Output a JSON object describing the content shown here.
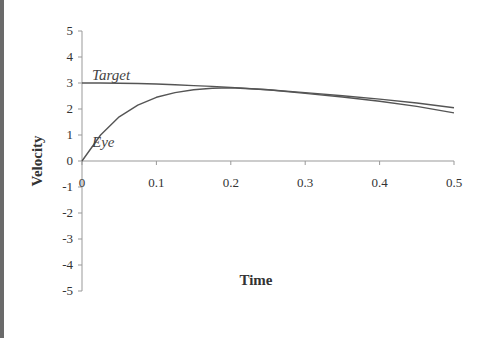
{
  "chart_data": {
    "type": "line",
    "title": "",
    "xlabel": "Time",
    "ylabel": "Velocity",
    "xlim": [
      0,
      0.5
    ],
    "ylim": [
      -5,
      5
    ],
    "x_ticks": [
      "0",
      "0.1",
      "0.2",
      "0.3",
      "0.4",
      "0.5"
    ],
    "y_ticks": [
      "5",
      "4",
      "3",
      "2",
      "1",
      "0",
      "-1",
      "-2",
      "-3",
      "-4",
      "-5"
    ],
    "grid": false,
    "legend": "inline labels",
    "x": [
      0,
      0.025,
      0.05,
      0.075,
      0.1,
      0.125,
      0.15,
      0.175,
      0.2,
      0.25,
      0.3,
      0.35,
      0.4,
      0.45,
      0.5
    ],
    "series": [
      {
        "name": "Target",
        "values": [
          3.0,
          3.0,
          2.99,
          2.98,
          2.96,
          2.93,
          2.9,
          2.87,
          2.83,
          2.74,
          2.63,
          2.51,
          2.38,
          2.23,
          2.05
        ]
      },
      {
        "name": "Eye",
        "values": [
          0.0,
          1.0,
          1.7,
          2.15,
          2.45,
          2.63,
          2.74,
          2.8,
          2.82,
          2.74,
          2.6,
          2.46,
          2.3,
          2.1,
          1.85
        ]
      }
    ],
    "annotations": [
      {
        "text": "Target",
        "x": 0.01,
        "y": 3.3
      },
      {
        "text": "Eye",
        "x": 0.01,
        "y": 0.6
      }
    ]
  },
  "labels": {
    "target": "Target",
    "eye": "Eye",
    "xlabel": "Time",
    "ylabel": "Velocity"
  }
}
